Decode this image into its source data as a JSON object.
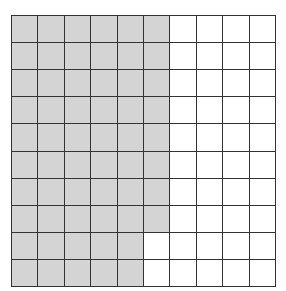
{
  "diagram": {
    "type": "hundred-grid",
    "rows": 10,
    "cols": 10,
    "shaded_color": "#d4d4d4",
    "unshaded_color": "#ffffff",
    "line_color": "#333333",
    "shaded_cols_per_row": [
      6,
      6,
      6,
      6,
      6,
      6,
      6,
      6,
      5,
      5
    ],
    "shaded_total": 58,
    "total_cells": 100
  }
}
